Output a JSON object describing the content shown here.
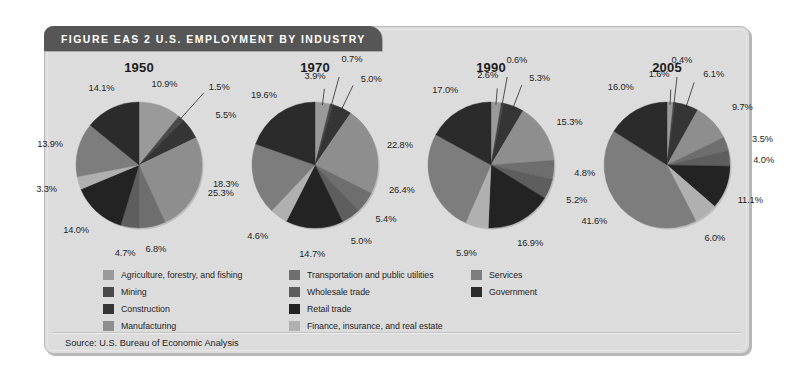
{
  "figure": {
    "header_title": "FIGURE EAS 2  U.S. EMPLOYMENT BY INDUSTRY",
    "source": "Source: U.S. Bureau of Economic Analysis"
  },
  "legend": {
    "columns": [
      [
        {
          "label": "Agriculture, forestry, and fishing",
          "color": "#9a9a9a",
          "swatch_name": "legend-swatch-agriculture"
        },
        {
          "label": "Mining",
          "color": "#4a4a4a",
          "swatch_name": "legend-swatch-mining"
        },
        {
          "label": "Construction",
          "color": "#353535",
          "swatch_name": "legend-swatch-construction"
        },
        {
          "label": "Manufacturing",
          "color": "#8e8e8e",
          "swatch_name": "legend-swatch-manufacturing"
        }
      ],
      [
        {
          "label": "Transportation and public utilities",
          "color": "#6e6e6e",
          "swatch_name": "legend-swatch-transportation"
        },
        {
          "label": "Wholesale trade",
          "color": "#5e5e5e",
          "swatch_name": "legend-swatch-wholesale"
        },
        {
          "label": "Retail trade",
          "color": "#232323",
          "swatch_name": "legend-swatch-retail"
        },
        {
          "label": "Finance, insurance, and real estate",
          "color": "#b0b0b0",
          "swatch_name": "legend-swatch-finance"
        }
      ],
      [
        {
          "label": "Services",
          "color": "#7d7d7d",
          "swatch_name": "legend-swatch-services"
        },
        {
          "label": "Government",
          "color": "#2b2b2b",
          "swatch_name": "legend-swatch-government"
        }
      ]
    ]
  },
  "chart_data": {
    "type": "pie",
    "title": "FIGURE EAS 2  U.S. EMPLOYMENT BY INDUSTRY",
    "subtitle": "",
    "xlabel": "",
    "ylabel": "",
    "grid": false,
    "legend_position": "bottom",
    "value_unit": "percent",
    "start_angle_deg": 0,
    "direction": "clockwise",
    "categories": [
      "Agriculture, forestry, and fishing",
      "Mining",
      "Construction",
      "Manufacturing",
      "Transportation and public utilities",
      "Wholesale trade",
      "Retail trade",
      "Finance, insurance, and real estate",
      "Services",
      "Government"
    ],
    "colors": [
      "#9a9a9a",
      "#4a4a4a",
      "#353535",
      "#8e8e8e",
      "#6e6e6e",
      "#5e5e5e",
      "#232323",
      "#b0b0b0",
      "#7d7d7d",
      "#2b2b2b"
    ],
    "panels": [
      {
        "name": "1950",
        "label": "1950",
        "values": [
          10.9,
          1.5,
          5.5,
          25.3,
          6.8,
          4.7,
          14.0,
          3.3,
          13.9,
          14.1
        ],
        "value_labels": [
          "10.9%",
          "1.5%",
          "5.5%",
          "25.3%",
          "6.8%",
          "4.7%",
          "14.0%",
          "3.3%",
          "13.9%",
          "14.1%"
        ]
      },
      {
        "name": "1970",
        "label": "1970",
        "values": [
          3.9,
          0.7,
          5.0,
          22.8,
          5.4,
          5.0,
          14.7,
          4.6,
          18.3,
          19.6
        ],
        "value_labels": [
          "3.9%",
          "0.7%",
          "5.0%",
          "22.8%",
          "5.4%",
          "5.0%",
          "14.7%",
          "4.6%",
          "18.3%",
          "19.6%"
        ]
      },
      {
        "name": "1990",
        "label": "1990",
        "values": [
          2.6,
          0.6,
          5.3,
          15.3,
          4.8,
          5.2,
          16.9,
          5.9,
          26.4,
          17.0
        ],
        "value_labels": [
          "2.6%",
          "0.6%",
          "5.3%",
          "15.3%",
          "4.8%",
          "5.2%",
          "16.9%",
          "5.9%",
          "26.4%",
          "17.0%"
        ]
      },
      {
        "name": "2005",
        "label": "2005",
        "values": [
          1.6,
          0.4,
          6.1,
          9.7,
          3.5,
          4.0,
          11.1,
          6.0,
          41.6,
          16.0
        ],
        "value_labels": [
          "1.6%",
          "0.4%",
          "6.1%",
          "9.7%",
          "3.5%",
          "4.0%",
          "11.1%",
          "6.0%",
          "41.6%",
          "16.0%"
        ]
      }
    ]
  }
}
